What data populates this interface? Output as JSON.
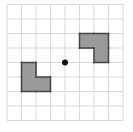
{
  "diagram": {
    "type": "grid-rotation",
    "grid": {
      "cols": 8,
      "rows": 8,
      "origin_x": 7,
      "origin_y": 4.5,
      "cell_size": 14.5,
      "line_color": "#d9d9d9"
    },
    "center_point": {
      "col": 4,
      "row": 4,
      "color": "#111111",
      "radius": 3
    },
    "shapes": [
      {
        "name": "left-l-shape",
        "cells": [
          [
            1,
            4
          ],
          [
            1,
            5
          ],
          [
            2,
            5
          ]
        ],
        "fill": "#9a9a9a",
        "stroke": "#444444"
      },
      {
        "name": "right-l-shape",
        "cells": [
          [
            5,
            2
          ],
          [
            6,
            2
          ],
          [
            6,
            3
          ]
        ],
        "fill": "#9a9a9a",
        "stroke": "#444444"
      }
    ]
  }
}
